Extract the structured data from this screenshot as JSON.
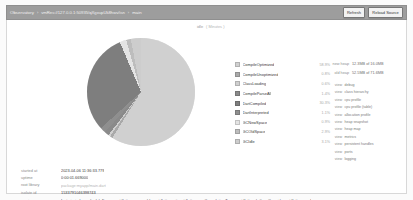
{
  "navbar": {
    "breadcrumbs": [
      {
        "label": "Observatory",
        "sep": "›"
      },
      {
        "label": "vmRes://127.0.0.1:50935/qXgxupUk8hwv/isn",
        "sep": "›"
      },
      {
        "label": "main",
        "sep": ""
      }
    ],
    "refresh_label": "Refresh",
    "reload_source_label": "Reload Source"
  },
  "header": {
    "idle_label": "idle",
    "idle_value": "( Minutes )"
  },
  "chart_data": {
    "type": "pie",
    "categories": [
      "CompileOptimized",
      "CompileUnoptimized",
      "ClassLoading",
      "CompileParseAll",
      "DartCompiled",
      "DartInterpreted",
      "GCNewSpace",
      "GCOldSpace",
      "GCIdle"
    ],
    "values": [
      58.9,
      0.8,
      0.6,
      1.4,
      30.3,
      1.1,
      0.9,
      2.9,
      3.1
    ],
    "labels": [
      "58.9%",
      "0.8%",
      "0.6%",
      "1.4%",
      "30.3%",
      "1.1%",
      "0.9%",
      "2.9%",
      "3.1%"
    ],
    "colors": [
      "#d0d0d0",
      "#a9a9a9",
      "#cfcfcf",
      "#8a8a8a",
      "#7e7e7e",
      "#8f8f8f",
      "#e4e4e4",
      "#bdbdbd",
      "#cdcdcd"
    ],
    "legend_position": "right",
    "grid": false
  },
  "stats": {
    "rows": [
      {
        "key": "new heap",
        "value": "12.3MB of 16.0MB"
      },
      {
        "key": "old heap",
        "value": "52.5MB of 71.6MB"
      }
    ]
  },
  "links": {
    "rows": [
      {
        "key": "view",
        "label": "debug"
      },
      {
        "key": "view",
        "label": "class hierarchy"
      },
      {
        "key": "view",
        "label": "cpu profile"
      },
      {
        "key": "view",
        "label": "cpu profile (table)"
      },
      {
        "key": "view",
        "label": "allocation profile"
      },
      {
        "key": "view",
        "label": "heap snapshot"
      },
      {
        "key": "view",
        "label": "heap map"
      },
      {
        "key": "view",
        "label": "metrics"
      },
      {
        "key": "view",
        "label": "persistent handles"
      },
      {
        "key": "view",
        "label": "ports"
      },
      {
        "key": "view",
        "label": "logging"
      }
    ]
  },
  "details": {
    "rows": [
      {
        "key": "started at",
        "value": "2023-04-06 11:36:33.779",
        "style": "plain"
      },
      {
        "key": "uptime",
        "value": "0:00:01.669000",
        "style": "plain"
      },
      {
        "key": "root library",
        "value": "package:myapp/main.dart",
        "style": "muted"
      },
      {
        "key": "isolate id",
        "value": "1533791046398743",
        "style": "plain"
      },
      {
        "key": "service",
        "value": "[ext.ui.window.scheduleFrame, ext.flutter.reassemble, ext.flutter.exit, ext.flutter.saveCompilationTrace, ext.flutter.platformOverride, ext.flutter.error]",
        "style": "link"
      }
    ]
  }
}
